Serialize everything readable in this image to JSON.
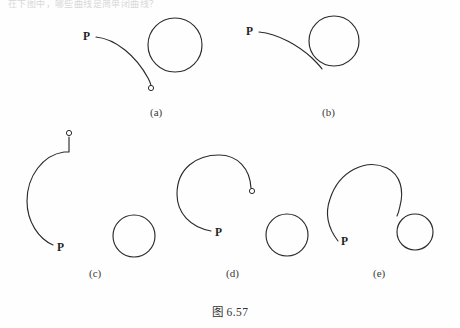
{
  "page": {
    "background_color": "#fefefe",
    "ink_color": "#2b2b2b",
    "top_cut_text": "在下图中，哪些曲线是简单闭曲线？",
    "caption": "图 6.57"
  },
  "figures": [
    {
      "id": "a",
      "sublabel": "(a)",
      "point_label": "P",
      "description": "open arc from P ending in a small open endpoint, separate circle to its right",
      "circles": [
        {
          "cx": 175,
          "cy": 45,
          "r": 27
        }
      ],
      "endpoint_marker": {
        "cx": 151,
        "cy": 88,
        "r": 2.6
      },
      "curve": "M 96 37 C 116 39 136 56 148 78 C 150 82 151 85 151 86"
    },
    {
      "id": "b",
      "sublabel": "(b)",
      "point_label": "P",
      "description": "arc from P running tangent into a circle, curve merges with the circle",
      "circles": [
        {
          "cx": 334,
          "cy": 41,
          "r": 25
        }
      ],
      "endpoint_marker": null,
      "curve": "M 259 32 C 279 34 299 46 312 58 C 318 64 320 66 321 68"
    },
    {
      "id": "c",
      "sublabel": "(c)",
      "point_label": "P",
      "description": "large open C-shaped arc with a straight stub ending in a small open endpoint, separate circle at right",
      "circles": [
        {
          "cx": 134,
          "cy": 236,
          "r": 21
        }
      ],
      "endpoint_marker": {
        "cx": 69,
        "cy": 133,
        "r": 2.6
      },
      "curve": "M 69 137 L 69 152 L 66 152 C 44 154 27 176 27 200 C 27 221 38 238 52 244",
      "curve2": ""
    },
    {
      "id": "d",
      "sublabel": "(d)",
      "point_label": "P",
      "description": "open spiral arc beginning at P and ending in a small open endpoint, separate circle at right",
      "circles": [
        {
          "cx": 287,
          "cy": 235,
          "r": 21
        }
      ],
      "endpoint_marker": {
        "cx": 252,
        "cy": 193,
        "r": 2.6
      },
      "curve": "M 210 231 C 190 228 177 214 177 195 C 177 169 197 155 219 155 C 238 155 250 170 251 188"
    },
    {
      "id": "e",
      "sublabel": "(e)",
      "point_label": "P",
      "description": "open arc from P curving around and meeting a smaller circle tangentially",
      "circles": [
        {
          "cx": 415,
          "cy": 232,
          "r": 18
        }
      ],
      "endpoint_marker": null,
      "curve": "M 337 240 C 328 228 326 214 330 200 C 338 172 365 159 386 168 C 400 174 404 190 400 205 C 399 210 398 213 397 215"
    }
  ],
  "point_labels": [
    {
      "figure": "a",
      "text": "P",
      "x": 83,
      "y": 31
    },
    {
      "figure": "b",
      "text": "P",
      "x": 246,
      "y": 26
    },
    {
      "figure": "c",
      "text": "P",
      "x": 57,
      "y": 242
    },
    {
      "figure": "d",
      "text": "P",
      "x": 215,
      "y": 227
    },
    {
      "figure": "e",
      "text": "P",
      "x": 341,
      "y": 236
    }
  ],
  "sublabels": [
    {
      "text": "(a)",
      "x": 150,
      "y": 107
    },
    {
      "text": "(b)",
      "x": 322,
      "y": 107
    },
    {
      "text": "(c)",
      "x": 89,
      "y": 268
    },
    {
      "text": "(d)",
      "x": 226,
      "y": 268
    },
    {
      "text": "(e)",
      "x": 373,
      "y": 268
    }
  ]
}
